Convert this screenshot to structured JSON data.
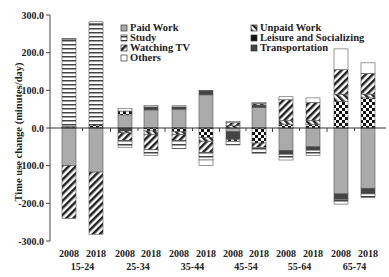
{
  "chart_data": {
    "type": "bar",
    "stacked": true,
    "title": "",
    "xlabel": "",
    "ylabel": "Time use change (minutes/day)",
    "ylim": [
      -300,
      300
    ],
    "yticks": [
      "300.0",
      "200.0",
      "100.0",
      "0.0",
      "-100.0",
      "-200.0",
      "-300.0"
    ],
    "groups": [
      "15-24",
      "25-34",
      "35-44",
      "45-54",
      "55-64",
      "65-74"
    ],
    "categories": [
      "2008",
      "2018",
      "2008",
      "2018",
      "2008",
      "2018",
      "2008",
      "2018",
      "2008",
      "2018",
      "2008",
      "2018"
    ],
    "legend": {
      "left": [
        "Paid Work",
        "Study",
        "Watching TV",
        "Others"
      ],
      "right": [
        "Unpaid Work",
        "Leisure and Socializing",
        "Transportation"
      ]
    },
    "series": [
      {
        "name": "Paid Work",
        "values": [
          -100,
          -117,
          35,
          48,
          50,
          88,
          -10,
          55,
          -60,
          -50,
          -175,
          -160
        ]
      },
      {
        "name": "Study",
        "values": [
          232,
          270,
          -18,
          -15,
          -22,
          -20,
          -10,
          -15,
          -15,
          -14,
          -12,
          -10
        ]
      },
      {
        "name": "Watching TV",
        "values": [
          -140,
          -165,
          -20,
          -40,
          -15,
          -30,
          8,
          -12,
          55,
          48,
          65,
          55
        ]
      },
      {
        "name": "Others",
        "values": [
          2,
          4,
          7,
          4,
          3,
          -15,
          3,
          3,
          8,
          12,
          55,
          28
        ]
      },
      {
        "name": "Unpaid Work",
        "values": [
          0,
          0,
          -5,
          -10,
          -8,
          -10,
          6,
          4,
          10,
          11,
          20,
          10
        ]
      },
      {
        "name": "Leisure and Socializing",
        "values": [
          2,
          6,
          10,
          -8,
          -10,
          -25,
          -5,
          -40,
          10,
          9,
          70,
          80
        ]
      },
      {
        "name": "Transportation",
        "values": [
          2,
          2,
          -8,
          8,
          6,
          12,
          -20,
          6,
          -10,
          -9,
          -15,
          -15
        ]
      }
    ],
    "totals_positive": [
      236,
      282,
      52,
      70,
      63,
      100,
      37,
      68,
      83,
      80,
      210,
      173
    ],
    "totals_negative": [
      -242,
      -283,
      -57,
      -72,
      -65,
      -107,
      -45,
      -78,
      -95,
      -95,
      -222,
      -185
    ],
    "grid": false,
    "legend_position": "top-inside"
  },
  "axis": {
    "ylabel": "Time use change (minutes/day)",
    "yticks": [
      "300.0",
      "200.0",
      "100.0",
      "0.0",
      "-100.0",
      "-200.0",
      "-300.0"
    ],
    "years": [
      "2008",
      "2018",
      "2008",
      "2018",
      "2008",
      "2018",
      "2008",
      "2018",
      "2008",
      "2018",
      "2008",
      "2018"
    ],
    "groups": [
      "15-24",
      "25-34",
      "35-44",
      "45-54",
      "55-64",
      "65-74"
    ]
  },
  "legend": {
    "paid": "Paid Work",
    "study": "Study",
    "tv": "Watching TV",
    "others": "Others",
    "unpaid": "Unpaid Work",
    "leisure": "Leisure and Socializing",
    "transport": "Transportation"
  }
}
